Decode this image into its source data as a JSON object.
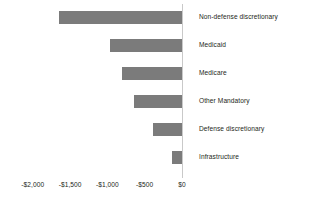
{
  "chart_data": {
    "type": "bar",
    "orientation": "horizontal",
    "title": "",
    "subtitle": "",
    "xlabel": "",
    "ylabel": "",
    "categories": [
      "Non-defense discretionary",
      "Medicaid",
      "Medicare",
      "Other Mandatory",
      "Defense discretionary",
      "Infrastructure"
    ],
    "values": [
      -1650,
      -960,
      -800,
      -650,
      -390,
      -135
    ],
    "xlim": [
      -2250,
      250
    ],
    "xticks": [
      -2000,
      -1500,
      -1000,
      -500,
      0
    ],
    "xtick_labels": [
      "-$2,000",
      "-$1,500",
      "-$1,000",
      "-$500",
      "$0"
    ],
    "grid": false,
    "legend": false,
    "bar_color": "#7b7b7b",
    "axis_line_color": "#c9c9c9",
    "text_color": "#231f20",
    "background_color": "#ffffff"
  },
  "axis": {
    "ticks": [
      {
        "label": "-$2,000",
        "value": -2000
      },
      {
        "label": "-$1,500",
        "value": -1500
      },
      {
        "label": "-$1,000",
        "value": -1000
      },
      {
        "label": "-$500",
        "value": -500
      },
      {
        "label": "$0",
        "value": 0
      }
    ]
  },
  "bars": [
    {
      "label": "Non-defense discretionary",
      "value": -1650
    },
    {
      "label": "Medicaid",
      "value": -960
    },
    {
      "label": "Medicare",
      "value": -800
    },
    {
      "label": "Other Mandatory",
      "value": -650
    },
    {
      "label": "Defense discretionary",
      "value": -390
    },
    {
      "label": "Infrastructure",
      "value": -135
    }
  ]
}
